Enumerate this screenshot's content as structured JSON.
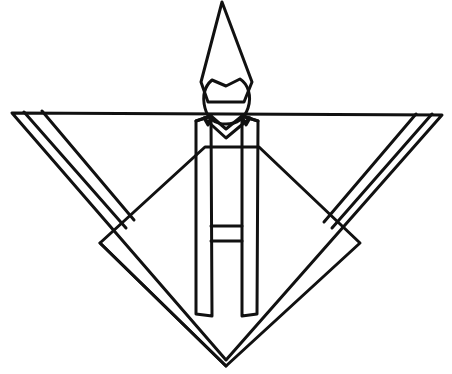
{
  "illustration": {
    "subject": "origami paper doll",
    "colors": {
      "paper_pink": "#f7d4e2",
      "hat_gray": "#cfcfcf",
      "face_white": "#ffffff",
      "outline": "#111111",
      "background": "#ffffff"
    },
    "parts": [
      "hat",
      "face",
      "sleeves",
      "robe-diamond",
      "collar-bands",
      "sash"
    ]
  }
}
